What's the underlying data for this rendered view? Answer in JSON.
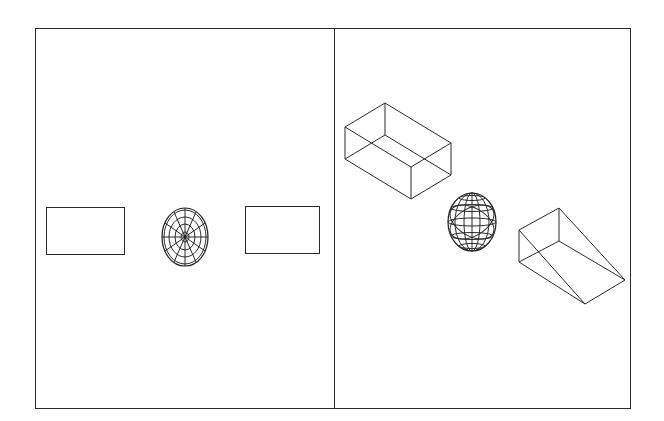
{
  "canvas": {
    "width": 664,
    "height": 421,
    "background": "#ffffff",
    "stroke": "#2a2a2a"
  },
  "frame": {
    "x": 35,
    "y": 28,
    "width": 595,
    "height": 380,
    "divider_x": 334
  },
  "left_view": {
    "name": "front-view",
    "objects": [
      {
        "type": "rectangle",
        "x": 46,
        "y": 207,
        "width": 78,
        "height": 47
      },
      {
        "type": "wireframe-sphere-polar",
        "cx": 185,
        "cy": 237,
        "rx": 23,
        "ry": 29
      },
      {
        "type": "rectangle",
        "x": 245,
        "y": 206,
        "width": 74,
        "height": 47
      }
    ]
  },
  "right_view": {
    "name": "isometric-view",
    "objects": [
      {
        "type": "wireframe-box"
      },
      {
        "type": "wireframe-sphere",
        "cx": 472,
        "cy": 222,
        "rx": 24,
        "ry": 29
      },
      {
        "type": "wireframe-wedge"
      }
    ]
  }
}
